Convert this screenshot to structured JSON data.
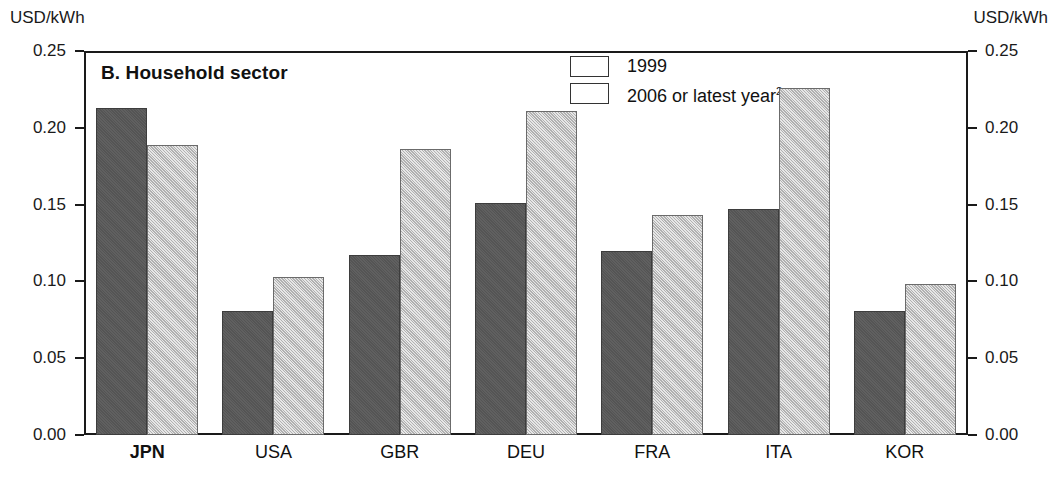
{
  "axis": {
    "unit_left": "USD/kWh",
    "unit_right": "USD/kWh",
    "ticks": [
      "0.25",
      "0.20",
      "0.15",
      "0.10",
      "0.05",
      "0.00"
    ]
  },
  "title": "B. Household sector",
  "legend": {
    "items": [
      {
        "label": "1999",
        "sup": "",
        "color": "#595959"
      },
      {
        "label": "2006 or latest year",
        "sup": "2",
        "color": "#c9c9c9"
      }
    ]
  },
  "chart_data": {
    "type": "bar",
    "title": "B. Household sector",
    "xlabel": "",
    "ylabel": "USD/kWh",
    "ylim": [
      0,
      0.25
    ],
    "ytick_step": 0.05,
    "grid": false,
    "legend_position": "top-center",
    "bold_categories": [
      "JPN"
    ],
    "categories": [
      "JPN",
      "USA",
      "GBR",
      "DEU",
      "FRA",
      "ITA",
      "KOR"
    ],
    "series": [
      {
        "name": "1999",
        "color": "#595959",
        "values": [
          0.213,
          0.081,
          0.117,
          0.151,
          0.12,
          0.147,
          0.081
        ]
      },
      {
        "name": "2006 or latest year2",
        "color": "#c9c9c9",
        "values": [
          0.189,
          0.103,
          0.186,
          0.211,
          0.143,
          0.226,
          0.098
        ]
      }
    ]
  }
}
